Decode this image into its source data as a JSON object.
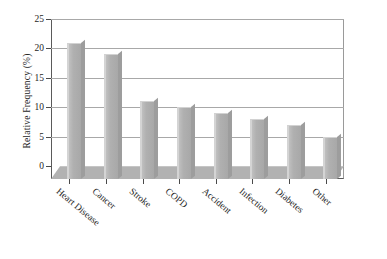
{
  "chart_data": {
    "type": "bar",
    "title": "",
    "subtitle": "",
    "xlabel": "",
    "ylabel": "Relative Frequency (%)",
    "categories": [
      "Heart Disease",
      "Cancer",
      "Stroke",
      "COPD",
      "Accident",
      "Infection",
      "Diabetes",
      "Other"
    ],
    "values": [
      21,
      19,
      11,
      10,
      9,
      8,
      7,
      5
    ],
    "series": [
      {
        "name": "Relative Frequency",
        "values": [
          21,
          19,
          11,
          10,
          9,
          8,
          7,
          5
        ]
      }
    ],
    "ylim": [
      0,
      25
    ],
    "ytick_labels": [
      "0",
      "5",
      "10",
      "15",
      "20",
      "25"
    ],
    "ytick_values": [
      0,
      5,
      10,
      15,
      20,
      25
    ],
    "xlim_categories": 8,
    "grid": "horizontal",
    "legend": "none",
    "style": "3d-bar",
    "bar_color": "#b4b4b4",
    "bar_highlight_color": "#d2d2d2",
    "floor_color": "#b2b2b2",
    "grid_color": "#a8a8a8",
    "axis_color": "#4a4a4a",
    "background_color": "#ffffff",
    "text_color": "#262626",
    "xtick_label_rotation": 40
  }
}
